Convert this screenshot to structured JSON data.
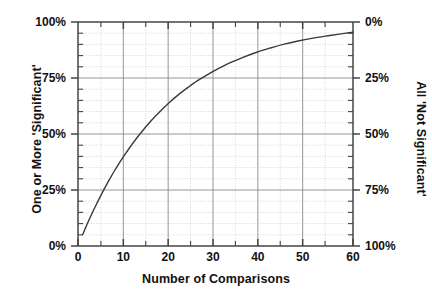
{
  "figure": {
    "background": "#ffffff",
    "line_color": "#3a3a3a",
    "grid_major_color": "#8a8a8a",
    "grid_minor_color": "#cccccc",
    "axis_color": "#444444"
  },
  "chart_data": {
    "type": "line",
    "title": "",
    "xlabel": "Number of  Comparisons",
    "ylabel": "One or More 'Significant'",
    "ylabel_right": "All 'Not Significant'",
    "xlim": [
      0,
      60
    ],
    "ylim": [
      0,
      100
    ],
    "ylim_right": [
      100,
      0
    ],
    "grid": true,
    "grid_major_x_step": 10,
    "grid_minor_x_step": 5,
    "grid_major_y_step": 25,
    "grid_minor_y_step": 5,
    "legend": "none",
    "xticks": [
      0,
      10,
      20,
      30,
      40,
      50,
      60
    ],
    "xticklabels": [
      "0",
      "10",
      "20",
      "30",
      "40",
      "50",
      "60"
    ],
    "yticks": [
      0,
      25,
      50,
      75,
      100
    ],
    "yticklabels": [
      "0%",
      "25%",
      "50%",
      "75%",
      "100%"
    ],
    "yticks_right": [
      0,
      25,
      50,
      75,
      100
    ],
    "yticklabels_right": [
      "0%",
      "25%",
      "50%",
      "75%",
      "100%"
    ],
    "series": [
      {
        "name": "One or More 'Significant'",
        "formula": "1 - 0.95^n",
        "x": [
          1,
          2,
          3,
          4,
          5,
          6,
          7,
          8,
          9,
          10,
          12,
          14,
          16,
          18,
          20,
          22,
          24,
          26,
          28,
          30,
          33,
          36,
          39,
          42,
          45,
          48,
          51,
          54,
          57,
          60
        ],
        "values": [
          5.0,
          9.8,
          14.3,
          18.5,
          22.6,
          26.5,
          30.2,
          33.7,
          37.0,
          40.1,
          46.0,
          51.2,
          56.0,
          60.3,
          64.2,
          67.7,
          70.8,
          73.7,
          76.2,
          78.5,
          81.6,
          84.2,
          86.5,
          88.4,
          90.1,
          91.5,
          92.7,
          93.7,
          94.6,
          95.4
        ]
      }
    ]
  }
}
